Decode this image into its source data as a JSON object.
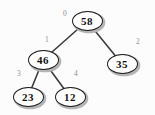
{
  "diagram": {
    "kind": "binary-tree",
    "colors": {
      "background": "#fcfcfc",
      "node_fill": "#ffffff",
      "node_border": "#1c1c1c",
      "node_shadow": "#b5b5b5",
      "node_text": "#111111",
      "edge": "#3d3d3d",
      "index_label": "#8f8f8f"
    },
    "nodes": [
      {
        "value": "58",
        "index": "0"
      },
      {
        "value": "46",
        "index": "1"
      },
      {
        "value": "35",
        "index": "2"
      },
      {
        "value": "23",
        "index": "3"
      },
      {
        "value": "12",
        "index": "4"
      }
    ],
    "edges": [
      {
        "from": "58",
        "to": "46"
      },
      {
        "from": "58",
        "to": "35"
      },
      {
        "from": "46",
        "to": "23"
      },
      {
        "from": "46",
        "to": "12"
      }
    ]
  }
}
